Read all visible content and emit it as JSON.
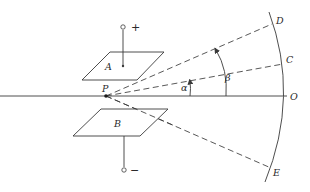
{
  "diagram": {
    "plates": [
      {
        "id": "A",
        "label": "A",
        "terminal": "+"
      },
      {
        "id": "B",
        "label": "B",
        "terminal": "−"
      }
    ],
    "origin_point": {
      "label": "P"
    },
    "screen_points": [
      {
        "id": "D",
        "label": "D"
      },
      {
        "id": "C",
        "label": "C"
      },
      {
        "id": "O",
        "label": "O"
      },
      {
        "id": "E",
        "label": "E"
      }
    ],
    "angles": [
      {
        "id": "alpha",
        "label": "α",
        "from": "O",
        "to": "C"
      },
      {
        "id": "beta",
        "label": "β",
        "from": "O",
        "to": "D"
      }
    ],
    "rays": [
      {
        "from": "P",
        "to": "O",
        "style": "solid"
      },
      {
        "from": "P",
        "to": "C",
        "style": "dashed"
      },
      {
        "from": "P",
        "to": "D",
        "style": "dashed"
      },
      {
        "from": "P",
        "to": "E",
        "style": "dashed"
      }
    ]
  }
}
